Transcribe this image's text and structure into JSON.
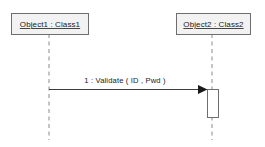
{
  "diagram": {
    "type": "uml-sequence-diagram",
    "title": "",
    "canvas": {
      "width": 265,
      "height": 147,
      "background": "#ffffff"
    },
    "colors": {
      "box_fill": "#f2f2f2",
      "box_stroke": "#6e6e6e",
      "lifeline_stroke": "#8a8a8a",
      "message_stroke": "#3d3d3d",
      "activation_fill": "#ffffff",
      "text": "#1a1a1a"
    },
    "lifelines": [
      {
        "id": "lifeline-1",
        "label": "Object1 : Class1",
        "object_name": "Object1",
        "class_name": "Class1",
        "box": {
          "x": 11,
          "y": 13,
          "width": 77,
          "height": 21
        },
        "line_x": 49,
        "line_y1": 34,
        "line_y2": 140
      },
      {
        "id": "lifeline-2",
        "label": "Object2 : Class2",
        "object_name": "Object2",
        "class_name": "Class2",
        "box": {
          "x": 176,
          "y": 13,
          "width": 74,
          "height": 21
        },
        "line_x": 212,
        "line_y1": 34,
        "line_y2": 140
      }
    ],
    "messages": [
      {
        "id": "message-1",
        "sequence_number": "1",
        "label": "1 : Validate ( ID , Pwd )",
        "operation": "Validate",
        "arguments": "ID , Pwd",
        "from": "lifeline-1",
        "to": "lifeline-2",
        "kind": "synchronous",
        "x1": 49,
        "x2": 208,
        "y": 89,
        "label_x": 125,
        "label_y": 81
      }
    ],
    "activations": [
      {
        "id": "activation-1",
        "on": "lifeline-2",
        "x": 207,
        "y": 89,
        "width": 11,
        "height": 28
      }
    ]
  }
}
